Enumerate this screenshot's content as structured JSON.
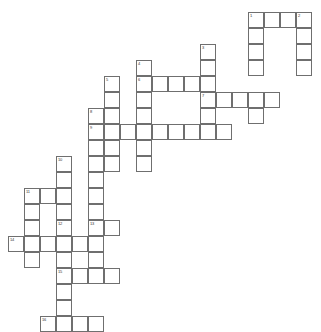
{
  "puzzle": {
    "title": "Crossword Grid",
    "cell_size": 16,
    "origin_x": 8,
    "origin_y": 12,
    "line_color": "#6f6f6f",
    "cell_color": "#ffffff",
    "background": "#ffffff",
    "number_color": "#333333",
    "entries": [
      {
        "number": "1",
        "direction": "across",
        "row": 0,
        "col": 15,
        "length": 4
      },
      {
        "number": "2",
        "direction": "down",
        "row": 0,
        "col": 18,
        "length": 4
      },
      {
        "number": "1",
        "direction": "down",
        "row": 0,
        "col": 15,
        "length": 4
      },
      {
        "number": "3",
        "direction": "down",
        "row": 2,
        "col": 12,
        "length": 5
      },
      {
        "number": "4",
        "direction": "down",
        "row": 3,
        "col": 8,
        "length": 5
      },
      {
        "number": "5",
        "direction": "down",
        "row": 4,
        "col": 6,
        "length": 5
      },
      {
        "number": "6",
        "direction": "across",
        "row": 4,
        "col": 8,
        "length": 4
      },
      {
        "number": "7",
        "direction": "across",
        "row": 5,
        "col": 12,
        "length": 5
      },
      {
        "number": "8",
        "direction": "down",
        "row": 6,
        "col": 5,
        "length": 6
      },
      {
        "number": "9",
        "direction": "across",
        "row": 7,
        "col": 5,
        "length": 9
      },
      {
        "number": "10",
        "direction": "down",
        "row": 9,
        "col": 3,
        "length": 5
      },
      {
        "number": "11",
        "direction": "across",
        "row": 11,
        "col": 1,
        "length": 3
      },
      {
        "number": "11",
        "direction": "down",
        "row": 11,
        "col": 1,
        "length": 4
      },
      {
        "number": "12",
        "direction": "down",
        "row": 13,
        "col": 3,
        "length": 4
      },
      {
        "number": "13",
        "direction": "down",
        "row": 13,
        "col": 5,
        "length": 3
      },
      {
        "number": "13",
        "direction": "across",
        "row": 13,
        "col": 5,
        "length": 2
      },
      {
        "number": "14",
        "direction": "across",
        "row": 14,
        "col": 0,
        "length": 5
      },
      {
        "number": "15",
        "direction": "across",
        "row": 16,
        "col": 3,
        "length": 4
      },
      {
        "number": "15",
        "direction": "down",
        "row": 16,
        "col": 3,
        "length": 3
      },
      {
        "number": "16",
        "direction": "across",
        "row": 19,
        "col": 2,
        "length": 4
      }
    ],
    "cells": [
      {
        "row": 0,
        "col": 15,
        "num": "1"
      },
      {
        "row": 0,
        "col": 16,
        "num": ""
      },
      {
        "row": 0,
        "col": 17,
        "num": ""
      },
      {
        "row": 0,
        "col": 18,
        "num": "2"
      },
      {
        "row": 1,
        "col": 15,
        "num": ""
      },
      {
        "row": 1,
        "col": 18,
        "num": ""
      },
      {
        "row": 2,
        "col": 12,
        "num": "3"
      },
      {
        "row": 2,
        "col": 15,
        "num": ""
      },
      {
        "row": 2,
        "col": 18,
        "num": ""
      },
      {
        "row": 3,
        "col": 8,
        "num": "4"
      },
      {
        "row": 3,
        "col": 12,
        "num": ""
      },
      {
        "row": 3,
        "col": 15,
        "num": ""
      },
      {
        "row": 3,
        "col": 18,
        "num": ""
      },
      {
        "row": 4,
        "col": 6,
        "num": "5"
      },
      {
        "row": 4,
        "col": 8,
        "num": "6"
      },
      {
        "row": 4,
        "col": 9,
        "num": ""
      },
      {
        "row": 4,
        "col": 10,
        "num": ""
      },
      {
        "row": 4,
        "col": 11,
        "num": ""
      },
      {
        "row": 4,
        "col": 12,
        "num": ""
      },
      {
        "row": 5,
        "col": 6,
        "num": ""
      },
      {
        "row": 5,
        "col": 8,
        "num": ""
      },
      {
        "row": 5,
        "col": 12,
        "num": "7"
      },
      {
        "row": 5,
        "col": 13,
        "num": ""
      },
      {
        "row": 5,
        "col": 14,
        "num": ""
      },
      {
        "row": 5,
        "col": 15,
        "num": ""
      },
      {
        "row": 5,
        "col": 16,
        "num": ""
      },
      {
        "row": 6,
        "col": 5,
        "num": "8"
      },
      {
        "row": 6,
        "col": 6,
        "num": ""
      },
      {
        "row": 6,
        "col": 8,
        "num": ""
      },
      {
        "row": 6,
        "col": 12,
        "num": ""
      },
      {
        "row": 6,
        "col": 15,
        "num": ""
      },
      {
        "row": 7,
        "col": 5,
        "num": "9"
      },
      {
        "row": 7,
        "col": 6,
        "num": ""
      },
      {
        "row": 7,
        "col": 7,
        "num": ""
      },
      {
        "row": 7,
        "col": 8,
        "num": ""
      },
      {
        "row": 7,
        "col": 9,
        "num": ""
      },
      {
        "row": 7,
        "col": 10,
        "num": ""
      },
      {
        "row": 7,
        "col": 11,
        "num": ""
      },
      {
        "row": 7,
        "col": 12,
        "num": ""
      },
      {
        "row": 7,
        "col": 13,
        "num": ""
      },
      {
        "row": 8,
        "col": 5,
        "num": ""
      },
      {
        "row": 8,
        "col": 6,
        "num": ""
      },
      {
        "row": 8,
        "col": 8,
        "num": ""
      },
      {
        "row": 9,
        "col": 3,
        "num": "10"
      },
      {
        "row": 9,
        "col": 5,
        "num": ""
      },
      {
        "row": 9,
        "col": 6,
        "num": ""
      },
      {
        "row": 9,
        "col": 8,
        "num": ""
      },
      {
        "row": 10,
        "col": 3,
        "num": ""
      },
      {
        "row": 10,
        "col": 5,
        "num": ""
      },
      {
        "row": 11,
        "col": 1,
        "num": "11"
      },
      {
        "row": 11,
        "col": 2,
        "num": ""
      },
      {
        "row": 11,
        "col": 3,
        "num": ""
      },
      {
        "row": 11,
        "col": 5,
        "num": ""
      },
      {
        "row": 12,
        "col": 1,
        "num": ""
      },
      {
        "row": 12,
        "col": 3,
        "num": ""
      },
      {
        "row": 12,
        "col": 5,
        "num": ""
      },
      {
        "row": 13,
        "col": 1,
        "num": ""
      },
      {
        "row": 13,
        "col": 3,
        "num": "12"
      },
      {
        "row": 13,
        "col": 5,
        "num": "13"
      },
      {
        "row": 13,
        "col": 6,
        "num": ""
      },
      {
        "row": 14,
        "col": 0,
        "num": "14"
      },
      {
        "row": 14,
        "col": 1,
        "num": ""
      },
      {
        "row": 14,
        "col": 2,
        "num": ""
      },
      {
        "row": 14,
        "col": 3,
        "num": ""
      },
      {
        "row": 14,
        "col": 4,
        "num": ""
      },
      {
        "row": 14,
        "col": 5,
        "num": ""
      },
      {
        "row": 15,
        "col": 1,
        "num": ""
      },
      {
        "row": 15,
        "col": 3,
        "num": ""
      },
      {
        "row": 15,
        "col": 5,
        "num": ""
      },
      {
        "row": 16,
        "col": 3,
        "num": "15"
      },
      {
        "row": 16,
        "col": 4,
        "num": ""
      },
      {
        "row": 16,
        "col": 5,
        "num": ""
      },
      {
        "row": 16,
        "col": 6,
        "num": ""
      },
      {
        "row": 17,
        "col": 3,
        "num": ""
      },
      {
        "row": 18,
        "col": 3,
        "num": ""
      },
      {
        "row": 19,
        "col": 2,
        "num": "16"
      },
      {
        "row": 19,
        "col": 3,
        "num": ""
      },
      {
        "row": 19,
        "col": 4,
        "num": ""
      },
      {
        "row": 19,
        "col": 5,
        "num": ""
      }
    ]
  }
}
